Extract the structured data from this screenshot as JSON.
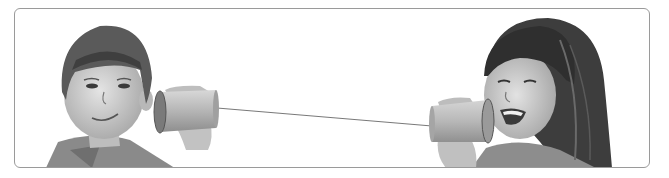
{
  "illustration": {
    "subject": "tin-can telephone",
    "left_figure": "boy listening through cup",
    "right_figure": "girl speaking into cup",
    "palette": {
      "background": "#ffffff",
      "frame": "#9a9a9a",
      "hair_dark": "#3a3a3a",
      "hair_mid": "#6b6b6b",
      "skin": "#d6d6d6",
      "cup": "#bcbcbc",
      "string": "#555555"
    }
  }
}
